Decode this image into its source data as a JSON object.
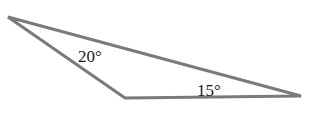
{
  "diagram": {
    "type": "triangle",
    "vertices": [
      {
        "name": "top-left",
        "x": 8,
        "y": 17
      },
      {
        "name": "bottom",
        "x": 125,
        "y": 98
      },
      {
        "name": "right",
        "x": 301,
        "y": 96
      }
    ],
    "stroke_color": "#7a7a7a",
    "angles": [
      {
        "label": "20°",
        "vertex": "top-left",
        "x": 78,
        "y": 62
      },
      {
        "label": "15°",
        "vertex": "right",
        "x": 197,
        "y": 96
      }
    ]
  }
}
